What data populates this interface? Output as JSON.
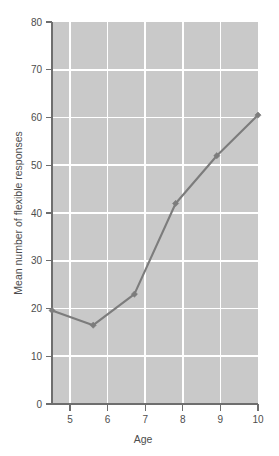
{
  "chart_data": {
    "type": "line",
    "title": "",
    "subtitle": "",
    "xlabel": "Age",
    "ylabel": "Mean number of flexible responses",
    "x": [
      5,
      6,
      7,
      8,
      9,
      10
    ],
    "values": [
      19.6,
      16.5,
      23.0,
      42.0,
      52.0,
      60.5
    ],
    "series": [
      {
        "name": "Mean number of flexible responses",
        "values": [
          19.6,
          16.5,
          23.0,
          42.0,
          52.0,
          60.5
        ]
      }
    ],
    "xlim": [
      5,
      10
    ],
    "ylim": [
      0,
      80
    ],
    "xticks": [
      "5",
      "6",
      "7",
      "8",
      "9",
      "10"
    ],
    "yticks": [
      "0",
      "10",
      "20",
      "30",
      "40",
      "50",
      "60",
      "70",
      "80"
    ],
    "grid": true,
    "legend": false,
    "legend_position": "none",
    "annotations": [],
    "colors": {
      "plot_background": "#c9c9c9",
      "page_background": "#ffffff",
      "gridline": "#ffffff",
      "axis": "#6e6e6e",
      "series": "#7c7c7c",
      "text": "#4d4d4d"
    },
    "marker": "diamond"
  }
}
